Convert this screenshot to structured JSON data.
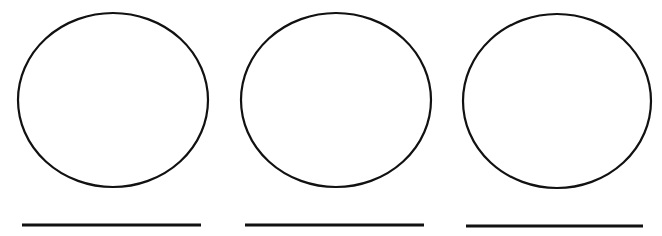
{
  "figure": {
    "stroke_color": "#111111",
    "background": "#ffffff",
    "items": [
      {
        "cx": 113,
        "cy": 100,
        "rx": 95,
        "ry": 87,
        "line_x1": 22,
        "line_x2": 201,
        "line_y": 225
      },
      {
        "cx": 336,
        "cy": 100,
        "rx": 95,
        "ry": 87,
        "line_x1": 245,
        "line_x2": 424,
        "line_y": 225
      },
      {
        "cx": 557,
        "cy": 101,
        "rx": 94,
        "ry": 87,
        "line_x1": 466,
        "line_x2": 643,
        "line_y": 226
      }
    ]
  }
}
